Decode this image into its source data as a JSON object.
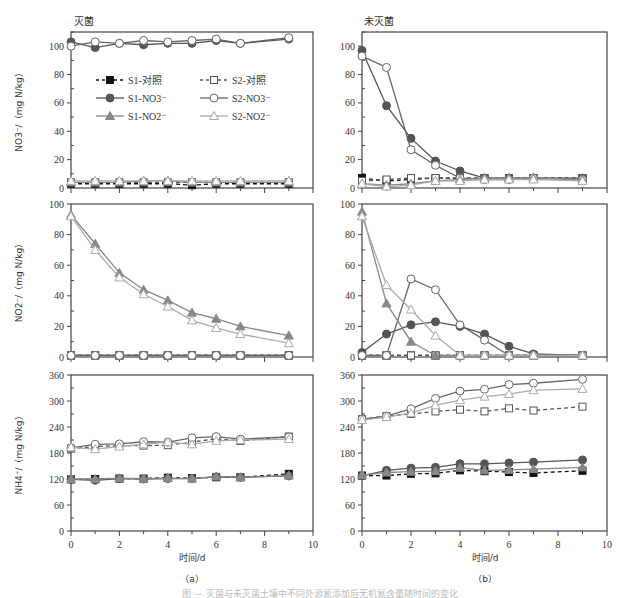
{
  "figure": {
    "panel_a_title": "灭菌",
    "panel_b_title": "未灭菌",
    "xlabel": "时间/d",
    "sub_a": "（a）",
    "sub_b": "（b）",
    "caption": "图 — 灭菌与未灭菌土壤中不同外源氮添加后无机氮含量随时间的变化"
  },
  "legend": [
    {
      "name": "S1-对照",
      "marker": "square",
      "fill": "filled",
      "line": "dashed"
    },
    {
      "name": "S2-对照",
      "marker": "square",
      "fill": "open",
      "line": "dashed"
    },
    {
      "name": "S1-NO3⁻",
      "marker": "circle",
      "fill": "filled",
      "line": "solid"
    },
    {
      "name": "S2-NO3⁻",
      "marker": "circle",
      "fill": "open",
      "line": "solid"
    },
    {
      "name": "S1-NO2⁻",
      "marker": "triangle",
      "fill": "filled",
      "line": "solid"
    },
    {
      "name": "S2-NO2⁻",
      "marker": "triangle",
      "fill": "open",
      "line": "solid"
    }
  ],
  "colors": {
    "S1_ctrl": "#111111",
    "S2_ctrl": "#555555",
    "S1_NO3": "#555555",
    "S2_NO3": "#666666",
    "S1_NO2": "#888888",
    "S2_NO2": "#aaaaaa",
    "axis": "#444444"
  },
  "chart_data": [
    {
      "type": "line",
      "panel": "a-top",
      "title": "灭菌",
      "ylabel": "NO3⁻/（mg N/kg）",
      "xlabel": "",
      "xlim": [
        0,
        10
      ],
      "ylim": [
        0,
        110
      ],
      "yticks": [
        0,
        20,
        40,
        60,
        80,
        100
      ],
      "xticks": [
        0,
        2,
        4,
        6,
        8,
        10
      ],
      "x": [
        0,
        1,
        2,
        3,
        4,
        5,
        6,
        7,
        9
      ],
      "series": [
        {
          "name": "S1-对照",
          "values": [
            3,
            3,
            3,
            3,
            3,
            2,
            3,
            3,
            3
          ]
        },
        {
          "name": "S2-对照",
          "values": [
            4,
            4,
            4,
            4,
            4,
            4,
            4,
            4,
            4
          ]
        },
        {
          "name": "S1-NO3⁻",
          "values": [
            103,
            99,
            102,
            101,
            102,
            102,
            104,
            102,
            105
          ]
        },
        {
          "name": "S2-NO3⁻",
          "values": [
            100,
            103,
            102,
            104,
            103,
            104,
            105,
            102,
            106
          ]
        },
        {
          "name": "S1-NO2⁻",
          "values": [
            4,
            4,
            4,
            5,
            5,
            4,
            4,
            4,
            4
          ]
        },
        {
          "name": "S2-NO2⁻",
          "values": [
            5,
            5,
            5,
            5,
            5,
            5,
            5,
            5,
            5
          ]
        }
      ]
    },
    {
      "type": "line",
      "panel": "a-middle",
      "ylabel": "NO2⁻/（mg N/kg）",
      "xlim": [
        0,
        10
      ],
      "ylim": [
        0,
        100
      ],
      "yticks": [
        0,
        20,
        40,
        60,
        80,
        100
      ],
      "xticks": [
        0,
        2,
        4,
        6,
        8,
        10
      ],
      "x": [
        0,
        1,
        2,
        3,
        4,
        5,
        6,
        7,
        9
      ],
      "series": [
        {
          "name": "S1-对照",
          "values": [
            1,
            1,
            1,
            1,
            1,
            1,
            1,
            1,
            1
          ]
        },
        {
          "name": "S2-对照",
          "values": [
            1,
            1,
            1,
            1,
            1,
            1,
            1,
            1,
            1
          ]
        },
        {
          "name": "S1-NO3⁻",
          "values": [
            1,
            1,
            1,
            1,
            1,
            1,
            1,
            1,
            1
          ]
        },
        {
          "name": "S2-NO3⁻",
          "values": [
            1,
            1,
            1,
            1,
            1,
            1,
            1,
            1,
            1
          ]
        },
        {
          "name": "S1-NO2⁻",
          "values": [
            93,
            74,
            55,
            44,
            37,
            29,
            25,
            20,
            14
          ]
        },
        {
          "name": "S2-NO2⁻",
          "values": [
            92,
            70,
            52,
            41,
            33,
            24,
            19,
            15,
            9
          ]
        }
      ]
    },
    {
      "type": "line",
      "panel": "a-bottom",
      "ylabel": "NH4⁺/（mg N/kg）",
      "xlabel": "时间/d",
      "xlim": [
        0,
        10
      ],
      "ylim": [
        0,
        360
      ],
      "yticks": [
        0,
        60,
        120,
        180,
        240,
        300,
        360
      ],
      "xticks": [
        0,
        2,
        4,
        6,
        8,
        10
      ],
      "x": [
        0,
        1,
        2,
        3,
        4,
        5,
        6,
        7,
        9
      ],
      "series": [
        {
          "name": "S1-对照",
          "values": [
            119,
            120,
            121,
            121,
            123,
            122,
            124,
            124,
            132
          ]
        },
        {
          "name": "S2-对照",
          "values": [
            190,
            195,
            197,
            197,
            198,
            205,
            213,
            208,
            218
          ]
        },
        {
          "name": "S1-NO3⁻",
          "values": [
            119,
            117,
            121,
            120,
            121,
            121,
            125,
            124,
            127
          ]
        },
        {
          "name": "S2-NO3⁻",
          "values": [
            192,
            200,
            201,
            206,
            205,
            215,
            218,
            212,
            217
          ]
        },
        {
          "name": "S1-NO2⁻",
          "values": [
            120,
            120,
            122,
            121,
            122,
            121,
            126,
            124,
            128
          ]
        },
        {
          "name": "S2-NO2⁻",
          "values": [
            193,
            189,
            195,
            200,
            205,
            200,
            208,
            210,
            212
          ]
        }
      ]
    },
    {
      "type": "line",
      "panel": "b-top",
      "title": "未灭菌",
      "xlim": [
        0,
        10
      ],
      "ylim": [
        0,
        110
      ],
      "yticks": [
        0,
        20,
        40,
        60,
        80,
        100
      ],
      "xticks": [
        0,
        2,
        4,
        6,
        8,
        10
      ],
      "x": [
        0,
        1,
        2,
        3,
        4,
        5,
        6,
        7,
        9
      ],
      "series": [
        {
          "name": "S1-对照",
          "values": [
            7,
            5,
            6,
            7,
            7,
            7,
            7,
            7,
            7
          ]
        },
        {
          "name": "S2-对照",
          "values": [
            5,
            6,
            7,
            7,
            7,
            7,
            7,
            7,
            7
          ]
        },
        {
          "name": "S1-NO3⁻",
          "values": [
            97,
            58,
            35,
            19,
            12,
            7,
            7,
            7,
            7
          ]
        },
        {
          "name": "S2-NO3⁻",
          "values": [
            93,
            85,
            27,
            16,
            7,
            6,
            6,
            7,
            6
          ]
        },
        {
          "name": "S1-NO2⁻",
          "values": [
            3,
            2,
            3,
            5,
            6,
            7,
            7,
            7,
            6
          ]
        },
        {
          "name": "S2-NO2⁻",
          "values": [
            3,
            1,
            2,
            5,
            5,
            6,
            6,
            6,
            5
          ]
        }
      ]
    },
    {
      "type": "line",
      "panel": "b-middle",
      "xlim": [
        0,
        10
      ],
      "ylim": [
        0,
        100
      ],
      "yticks": [
        0,
        20,
        40,
        60,
        80,
        100
      ],
      "xticks": [
        0,
        2,
        4,
        6,
        8,
        10
      ],
      "x": [
        0,
        1,
        2,
        3,
        4,
        5,
        6,
        7,
        9
      ],
      "series": [
        {
          "name": "S1-对照",
          "values": [
            1,
            1,
            1,
            1,
            1,
            1,
            1,
            1,
            1
          ]
        },
        {
          "name": "S2-对照",
          "values": [
            1,
            1,
            1,
            1,
            1,
            1,
            1,
            1,
            1
          ]
        },
        {
          "name": "S1-NO3⁻",
          "values": [
            3,
            15,
            21,
            23,
            20,
            15,
            7,
            2,
            1
          ]
        },
        {
          "name": "S2-NO3⁻",
          "values": [
            1,
            1,
            51,
            44,
            21,
            11,
            1,
            1,
            1
          ]
        },
        {
          "name": "S1-NO2⁻",
          "values": [
            95,
            35,
            10,
            1,
            1,
            1,
            1,
            1,
            1
          ]
        },
        {
          "name": "S2-NO2⁻",
          "values": [
            92,
            47,
            31,
            14,
            1,
            1,
            1,
            1,
            1
          ]
        }
      ]
    },
    {
      "type": "line",
      "panel": "b-bottom",
      "xlabel": "时间/d",
      "xlim": [
        0,
        10
      ],
      "ylim": [
        0,
        360
      ],
      "yticks": [
        0,
        60,
        120,
        180,
        240,
        300,
        360
      ],
      "xticks": [
        0,
        2,
        4,
        6,
        8,
        10
      ],
      "x": [
        0,
        1,
        2,
        3,
        4,
        5,
        6,
        7,
        9
      ],
      "series": [
        {
          "name": "S1-对照",
          "values": [
            128,
            128,
            132,
            133,
            140,
            138,
            136,
            134,
            139
          ]
        },
        {
          "name": "S2-对照",
          "values": [
            258,
            265,
            270,
            276,
            280,
            276,
            283,
            278,
            287
          ]
        },
        {
          "name": "S1-NO3⁻",
          "values": [
            127,
            140,
            145,
            147,
            155,
            155,
            157,
            159,
            164
          ]
        },
        {
          "name": "S2-NO3⁻",
          "values": [
            258,
            265,
            282,
            306,
            323,
            327,
            338,
            341,
            350
          ]
        },
        {
          "name": "S1-NO2⁻",
          "values": [
            129,
            135,
            137,
            138,
            146,
            140,
            141,
            143,
            147
          ]
        },
        {
          "name": "S2-NO2⁻",
          "values": [
            256,
            263,
            272,
            290,
            302,
            310,
            316,
            325,
            328
          ]
        }
      ]
    }
  ]
}
